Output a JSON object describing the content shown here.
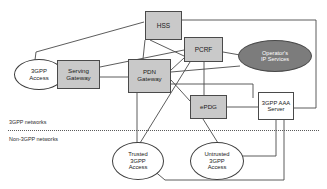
{
  "diagram": {
    "background": "#ffffff",
    "zones": [
      {
        "id": "zone-3gpp",
        "label": "3GPP networks"
      },
      {
        "id": "zone-non3gpp",
        "label": "Non-3GPP networks"
      }
    ],
    "colors": {
      "box_gray": "#c9c9c9",
      "box_white": "#ffffff",
      "ellipse_dark": "#7c7c7c",
      "stroke": "#4a4a4a",
      "divider": "#5a5a5a"
    },
    "nodes": [
      {
        "id": "hss",
        "label": "HSS",
        "shape": "box",
        "fill": "gray"
      },
      {
        "id": "pcrf",
        "label": "PCRF",
        "shape": "box",
        "fill": "gray"
      },
      {
        "id": "operator-ip",
        "label": "Operator's\nIP Services",
        "shape": "ellipse",
        "fill": "dark"
      },
      {
        "id": "3gpp-access",
        "label": "3GPP\nAccess",
        "shape": "ellipse",
        "fill": "white"
      },
      {
        "id": "serving-gw",
        "label": "Serving\nGateway",
        "shape": "box",
        "fill": "gray"
      },
      {
        "id": "pdn-gw",
        "label": "PDN\nGateway",
        "shape": "box",
        "fill": "gray"
      },
      {
        "id": "epdg",
        "label": "ePDG",
        "shape": "box",
        "fill": "gray"
      },
      {
        "id": "aaa-server",
        "label": "3GPP AAA\nServer",
        "shape": "box",
        "fill": "white"
      },
      {
        "id": "trusted",
        "label": "Trusted\n3GPP\nAccess",
        "shape": "ellipse",
        "fill": "white"
      },
      {
        "id": "untrusted",
        "label": "Untrusted\n3GPP\nAccess",
        "shape": "ellipse",
        "fill": "white"
      }
    ],
    "links": [
      {
        "from": "3gpp-access",
        "to": "serving-gw"
      },
      {
        "from": "3gpp-access",
        "to": "hss"
      },
      {
        "from": "serving-gw",
        "to": "pdn-gw"
      },
      {
        "from": "serving-gw",
        "to": "pcrf"
      },
      {
        "from": "hss",
        "to": "pdn-gw"
      },
      {
        "from": "hss",
        "to": "aaa-server"
      },
      {
        "from": "pcrf",
        "to": "pdn-gw"
      },
      {
        "from": "pcrf",
        "to": "operator-ip"
      },
      {
        "from": "pcrf",
        "to": "epdg"
      },
      {
        "from": "pcrf",
        "to": "trusted"
      },
      {
        "from": "pdn-gw",
        "to": "operator-ip"
      },
      {
        "from": "pdn-gw",
        "to": "epdg"
      },
      {
        "from": "pdn-gw",
        "to": "aaa-server"
      },
      {
        "from": "pdn-gw",
        "to": "trusted"
      },
      {
        "from": "epdg",
        "to": "aaa-server"
      },
      {
        "from": "epdg",
        "to": "untrusted"
      },
      {
        "from": "aaa-server",
        "to": "untrusted"
      },
      {
        "from": "aaa-server",
        "to": "trusted"
      }
    ]
  }
}
